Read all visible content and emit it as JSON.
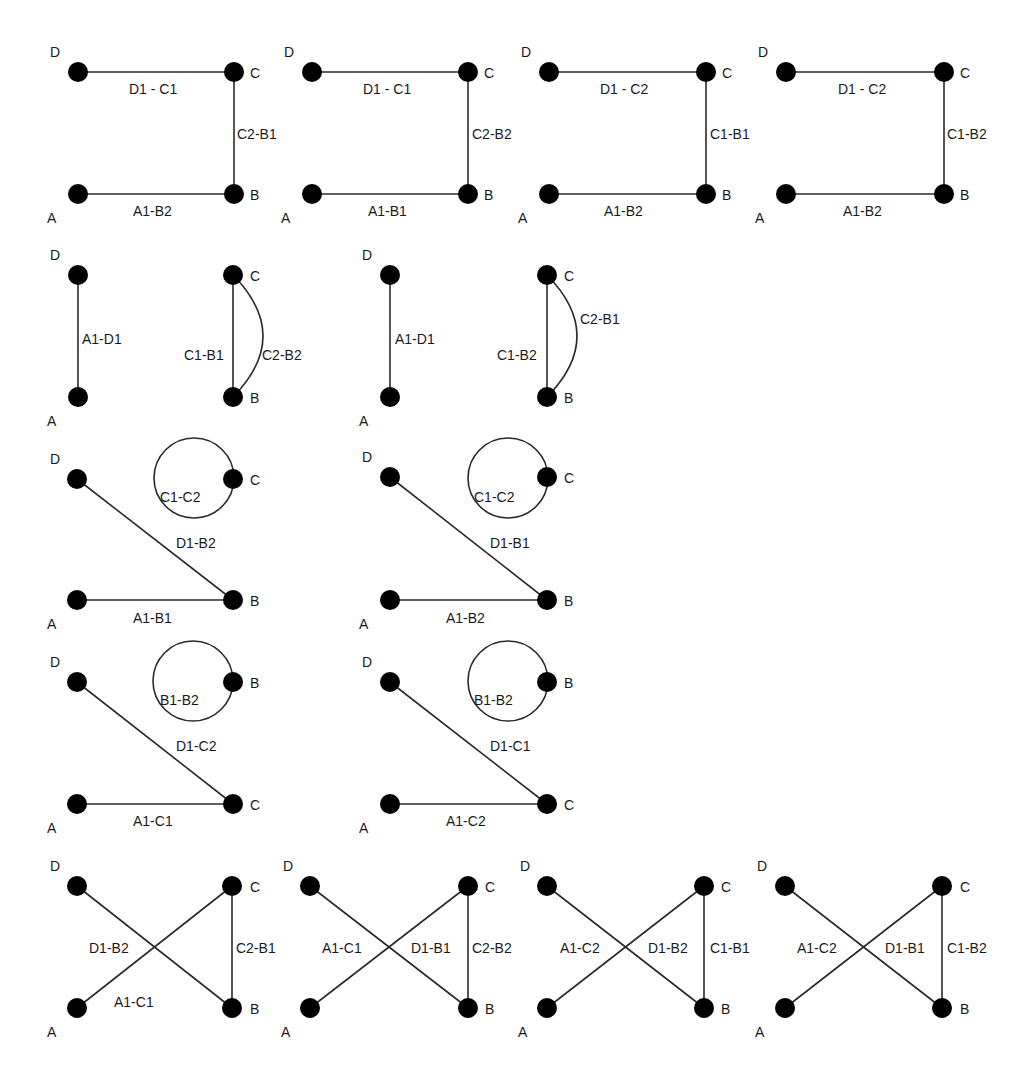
{
  "figure": {
    "node_radius": 10,
    "colors": {
      "node": "#000000",
      "edge": "#2a2a2a",
      "text": "#1a1a1a",
      "background": "#ffffff"
    },
    "panels": [
      {
        "id": "r1p1",
        "nodes": {
          "D": [
            78,
            72
          ],
          "C": [
            234,
            72
          ],
          "A": [
            78,
            194
          ],
          "B": [
            234,
            194
          ]
        },
        "node_labels": [
          {
            "text": "D",
            "x": 50,
            "y": 44
          },
          {
            "text": "C",
            "x": 250,
            "y": 65
          },
          {
            "text": "A",
            "x": 47,
            "y": 210
          },
          {
            "text": "B",
            "x": 250,
            "y": 187
          }
        ],
        "edges": [
          {
            "type": "line",
            "from": "D",
            "to": "C"
          },
          {
            "type": "line",
            "from": "C",
            "to": "B"
          },
          {
            "type": "line",
            "from": "A",
            "to": "B"
          }
        ],
        "edge_labels": [
          {
            "text": "D1 - C1",
            "x": 129,
            "y": 81
          },
          {
            "text": "C2-B1",
            "x": 237,
            "y": 126
          },
          {
            "text": "A1-B2",
            "x": 133,
            "y": 203
          }
        ]
      },
      {
        "id": "r1p2",
        "nodes": {
          "D": [
            312,
            72
          ],
          "C": [
            468,
            72
          ],
          "A": [
            312,
            194
          ],
          "B": [
            468,
            194
          ]
        },
        "node_labels": [
          {
            "text": "D",
            "x": 284,
            "y": 44
          },
          {
            "text": "C",
            "x": 484,
            "y": 65
          },
          {
            "text": "A",
            "x": 281,
            "y": 210
          },
          {
            "text": "B",
            "x": 484,
            "y": 187
          }
        ],
        "edges": [
          {
            "type": "line",
            "from": "D",
            "to": "C"
          },
          {
            "type": "line",
            "from": "C",
            "to": "B"
          },
          {
            "type": "line",
            "from": "A",
            "to": "B"
          }
        ],
        "edge_labels": [
          {
            "text": "D1 - C1",
            "x": 363,
            "y": 81
          },
          {
            "text": "C2-B2",
            "x": 472,
            "y": 126
          },
          {
            "text": "A1-B1",
            "x": 368,
            "y": 203
          }
        ]
      },
      {
        "id": "r1p3",
        "nodes": {
          "D": [
            549,
            72
          ],
          "C": [
            706,
            72
          ],
          "A": [
            549,
            194
          ],
          "B": [
            706,
            194
          ]
        },
        "node_labels": [
          {
            "text": "D",
            "x": 521,
            "y": 44
          },
          {
            "text": "C",
            "x": 722,
            "y": 65
          },
          {
            "text": "A",
            "x": 518,
            "y": 210
          },
          {
            "text": "B",
            "x": 722,
            "y": 187
          }
        ],
        "edges": [
          {
            "type": "line",
            "from": "D",
            "to": "C"
          },
          {
            "type": "line",
            "from": "C",
            "to": "B"
          },
          {
            "type": "line",
            "from": "A",
            "to": "B"
          }
        ],
        "edge_labels": [
          {
            "text": "D1 - C2",
            "x": 600,
            "y": 81
          },
          {
            "text": "C1-B1",
            "x": 710,
            "y": 126
          },
          {
            "text": "A1-B2",
            "x": 604,
            "y": 203
          }
        ]
      },
      {
        "id": "r1p4",
        "nodes": {
          "D": [
            786,
            72
          ],
          "C": [
            944,
            72
          ],
          "A": [
            786,
            194
          ],
          "B": [
            944,
            194
          ]
        },
        "node_labels": [
          {
            "text": "D",
            "x": 758,
            "y": 44
          },
          {
            "text": "C",
            "x": 960,
            "y": 65
          },
          {
            "text": "A",
            "x": 755,
            "y": 210
          },
          {
            "text": "B",
            "x": 960,
            "y": 187
          }
        ],
        "edges": [
          {
            "type": "line",
            "from": "D",
            "to": "C"
          },
          {
            "type": "line",
            "from": "C",
            "to": "B"
          },
          {
            "type": "line",
            "from": "A",
            "to": "B"
          }
        ],
        "edge_labels": [
          {
            "text": "D1 - C2",
            "x": 838,
            "y": 81
          },
          {
            "text": "C1-B2",
            "x": 947,
            "y": 126
          },
          {
            "text": "A1-B2",
            "x": 843,
            "y": 203
          }
        ]
      },
      {
        "id": "r2p1",
        "nodes": {
          "D": [
            78,
            275
          ],
          "C": [
            233,
            275
          ],
          "A": [
            78,
            397
          ],
          "B": [
            233,
            397
          ]
        },
        "node_labels": [
          {
            "text": "D",
            "x": 50,
            "y": 247
          },
          {
            "text": "C",
            "x": 250,
            "y": 268
          },
          {
            "text": "A",
            "x": 47,
            "y": 413
          },
          {
            "text": "B",
            "x": 250,
            "y": 390
          }
        ],
        "edges": [
          {
            "type": "line",
            "from": "D",
            "to": "A"
          },
          {
            "type": "line",
            "from": "C",
            "to": "B"
          },
          {
            "type": "arc",
            "from": "C",
            "to": "B",
            "bulge": 30
          }
        ],
        "edge_labels": [
          {
            "text": "A1-D1",
            "x": 82,
            "y": 331
          },
          {
            "text": "C1-B1",
            "x": 184,
            "y": 347
          },
          {
            "text": "C2-B2",
            "x": 262,
            "y": 347
          }
        ]
      },
      {
        "id": "r2p2",
        "nodes": {
          "D": [
            390,
            275
          ],
          "C": [
            547,
            275
          ],
          "A": [
            390,
            397
          ],
          "B": [
            547,
            397
          ]
        },
        "node_labels": [
          {
            "text": "D",
            "x": 362,
            "y": 247
          },
          {
            "text": "C",
            "x": 564,
            "y": 268
          },
          {
            "text": "A",
            "x": 359,
            "y": 413
          },
          {
            "text": "B",
            "x": 564,
            "y": 390
          }
        ],
        "edges": [
          {
            "type": "line",
            "from": "D",
            "to": "A"
          },
          {
            "type": "line",
            "from": "C",
            "to": "B"
          },
          {
            "type": "arc",
            "from": "C",
            "to": "B",
            "bulge": 30
          }
        ],
        "edge_labels": [
          {
            "text": "A1-D1",
            "x": 395,
            "y": 331
          },
          {
            "text": "C1-B2",
            "x": 497,
            "y": 347
          },
          {
            "text": "C2-B1",
            "x": 580,
            "y": 311
          }
        ]
      },
      {
        "id": "r3p1",
        "nodes": {
          "D": [
            77,
            479
          ],
          "C": [
            233,
            479
          ],
          "A": [
            77,
            600
          ],
          "B": [
            233,
            600
          ]
        },
        "node_labels": [
          {
            "text": "D",
            "x": 50,
            "y": 451
          },
          {
            "text": "C",
            "x": 250,
            "y": 472
          },
          {
            "text": "A",
            "x": 47,
            "y": 616
          },
          {
            "text": "B",
            "x": 250,
            "y": 593
          }
        ],
        "edges": [
          {
            "type": "line",
            "from": "D",
            "to": "B"
          },
          {
            "type": "line",
            "from": "A",
            "to": "B"
          },
          {
            "type": "loop",
            "cx": 194,
            "cy": 478,
            "r": 40
          }
        ],
        "edge_labels": [
          {
            "text": "C1-C2",
            "x": 160,
            "y": 489
          },
          {
            "text": "D1-B2",
            "x": 176,
            "y": 535
          },
          {
            "text": "A1-B1",
            "x": 133,
            "y": 610
          }
        ]
      },
      {
        "id": "r3p2",
        "nodes": {
          "D": [
            390,
            477
          ],
          "C": [
            547,
            477
          ],
          "A": [
            390,
            600
          ],
          "B": [
            547,
            600
          ]
        },
        "node_labels": [
          {
            "text": "D",
            "x": 362,
            "y": 449
          },
          {
            "text": "C",
            "x": 564,
            "y": 470
          },
          {
            "text": "A",
            "x": 359,
            "y": 616
          },
          {
            "text": "B",
            "x": 564,
            "y": 593
          }
        ],
        "edges": [
          {
            "type": "line",
            "from": "D",
            "to": "B"
          },
          {
            "type": "line",
            "from": "A",
            "to": "B"
          },
          {
            "type": "loop",
            "cx": 508,
            "cy": 478,
            "r": 40
          }
        ],
        "edge_labels": [
          {
            "text": "C1-C2",
            "x": 474,
            "y": 489
          },
          {
            "text": "D1-B1",
            "x": 490,
            "y": 535
          },
          {
            "text": "A1-B2",
            "x": 446,
            "y": 610
          }
        ]
      },
      {
        "id": "r4p1",
        "nodes": {
          "D": [
            77,
            682
          ],
          "B": [
            233,
            682
          ],
          "A": [
            77,
            804
          ],
          "C": [
            233,
            804
          ]
        },
        "node_labels": [
          {
            "text": "D",
            "x": 50,
            "y": 654
          },
          {
            "text": "B",
            "x": 250,
            "y": 675
          },
          {
            "text": "A",
            "x": 47,
            "y": 820
          },
          {
            "text": "C",
            "x": 250,
            "y": 797
          }
        ],
        "edges": [
          {
            "type": "line",
            "from": "D",
            "to": "C"
          },
          {
            "type": "line",
            "from": "A",
            "to": "C"
          },
          {
            "type": "loop",
            "cx": 193,
            "cy": 681,
            "r": 40
          }
        ],
        "edge_labels": [
          {
            "text": "B1-B2",
            "x": 160,
            "y": 692
          },
          {
            "text": "D1-C2",
            "x": 176,
            "y": 738
          },
          {
            "text": "A1-C1",
            "x": 133,
            "y": 813
          }
        ]
      },
      {
        "id": "r4p2",
        "nodes": {
          "D": [
            390,
            682
          ],
          "B": [
            547,
            682
          ],
          "A": [
            390,
            804
          ],
          "C": [
            547,
            804
          ]
        },
        "node_labels": [
          {
            "text": "D",
            "x": 362,
            "y": 654
          },
          {
            "text": "B",
            "x": 564,
            "y": 675
          },
          {
            "text": "A",
            "x": 359,
            "y": 820
          },
          {
            "text": "C",
            "x": 564,
            "y": 797
          }
        ],
        "edges": [
          {
            "type": "line",
            "from": "D",
            "to": "C"
          },
          {
            "type": "line",
            "from": "A",
            "to": "C"
          },
          {
            "type": "loop",
            "cx": 508,
            "cy": 681,
            "r": 40
          }
        ],
        "edge_labels": [
          {
            "text": "B1-B2",
            "x": 474,
            "y": 692
          },
          {
            "text": "D1-C1",
            "x": 490,
            "y": 738
          },
          {
            "text": "A1-C2",
            "x": 446,
            "y": 813
          }
        ]
      },
      {
        "id": "r5p1",
        "nodes": {
          "D": [
            77,
            886
          ],
          "C": [
            232,
            886
          ],
          "A": [
            77,
            1008
          ],
          "B": [
            232,
            1008
          ]
        },
        "node_labels": [
          {
            "text": "D",
            "x": 50,
            "y": 858
          },
          {
            "text": "C",
            "x": 250,
            "y": 879
          },
          {
            "text": "A",
            "x": 47,
            "y": 1024
          },
          {
            "text": "B",
            "x": 250,
            "y": 1001
          }
        ],
        "edges": [
          {
            "type": "line",
            "from": "D",
            "to": "B"
          },
          {
            "type": "line",
            "from": "A",
            "to": "C"
          },
          {
            "type": "line",
            "from": "C",
            "to": "B"
          }
        ],
        "edge_labels": [
          {
            "text": "D1-B2",
            "x": 89,
            "y": 940
          },
          {
            "text": "C2-B1",
            "x": 236,
            "y": 940
          },
          {
            "text": "A1-C1",
            "x": 114,
            "y": 994
          }
        ]
      },
      {
        "id": "r5p2",
        "nodes": {
          "D": [
            310,
            886
          ],
          "C": [
            468,
            886
          ],
          "A": [
            310,
            1008
          ],
          "B": [
            468,
            1008
          ]
        },
        "node_labels": [
          {
            "text": "D",
            "x": 283,
            "y": 858
          },
          {
            "text": "C",
            "x": 485,
            "y": 879
          },
          {
            "text": "A",
            "x": 281,
            "y": 1024
          },
          {
            "text": "B",
            "x": 485,
            "y": 1001
          }
        ],
        "edges": [
          {
            "type": "line",
            "from": "D",
            "to": "B"
          },
          {
            "type": "line",
            "from": "A",
            "to": "C"
          },
          {
            "type": "line",
            "from": "C",
            "to": "B"
          }
        ],
        "edge_labels": [
          {
            "text": "A1-C1",
            "x": 322,
            "y": 940
          },
          {
            "text": "D1-B1",
            "x": 411,
            "y": 940
          },
          {
            "text": "C2-B2",
            "x": 472,
            "y": 940
          }
        ]
      },
      {
        "id": "r5p3",
        "nodes": {
          "D": [
            547,
            886
          ],
          "C": [
            704,
            886
          ],
          "A": [
            547,
            1008
          ],
          "B": [
            704,
            1008
          ]
        },
        "node_labels": [
          {
            "text": "D",
            "x": 520,
            "y": 858
          },
          {
            "text": "C",
            "x": 721,
            "y": 879
          },
          {
            "text": "A",
            "x": 518,
            "y": 1024
          },
          {
            "text": "B",
            "x": 721,
            "y": 1001
          }
        ],
        "edges": [
          {
            "type": "line",
            "from": "D",
            "to": "B"
          },
          {
            "type": "line",
            "from": "A",
            "to": "C"
          },
          {
            "type": "line",
            "from": "C",
            "to": "B"
          }
        ],
        "edge_labels": [
          {
            "text": "A1-C2",
            "x": 560,
            "y": 940
          },
          {
            "text": "D1-B2",
            "x": 648,
            "y": 940
          },
          {
            "text": "C1-B1",
            "x": 710,
            "y": 940
          }
        ]
      },
      {
        "id": "r5p4",
        "nodes": {
          "D": [
            785,
            886
          ],
          "C": [
            942,
            886
          ],
          "A": [
            785,
            1008
          ],
          "B": [
            942,
            1008
          ]
        },
        "node_labels": [
          {
            "text": "D",
            "x": 757,
            "y": 858
          },
          {
            "text": "C",
            "x": 960,
            "y": 879
          },
          {
            "text": "A",
            "x": 755,
            "y": 1024
          },
          {
            "text": "B",
            "x": 960,
            "y": 1001
          }
        ],
        "edges": [
          {
            "type": "line",
            "from": "D",
            "to": "B"
          },
          {
            "type": "line",
            "from": "A",
            "to": "C"
          },
          {
            "type": "line",
            "from": "C",
            "to": "B"
          }
        ],
        "edge_labels": [
          {
            "text": "A1-C2",
            "x": 797,
            "y": 940
          },
          {
            "text": "D1-B1",
            "x": 885,
            "y": 940
          },
          {
            "text": "C1-B2",
            "x": 947,
            "y": 940
          }
        ]
      }
    ]
  }
}
